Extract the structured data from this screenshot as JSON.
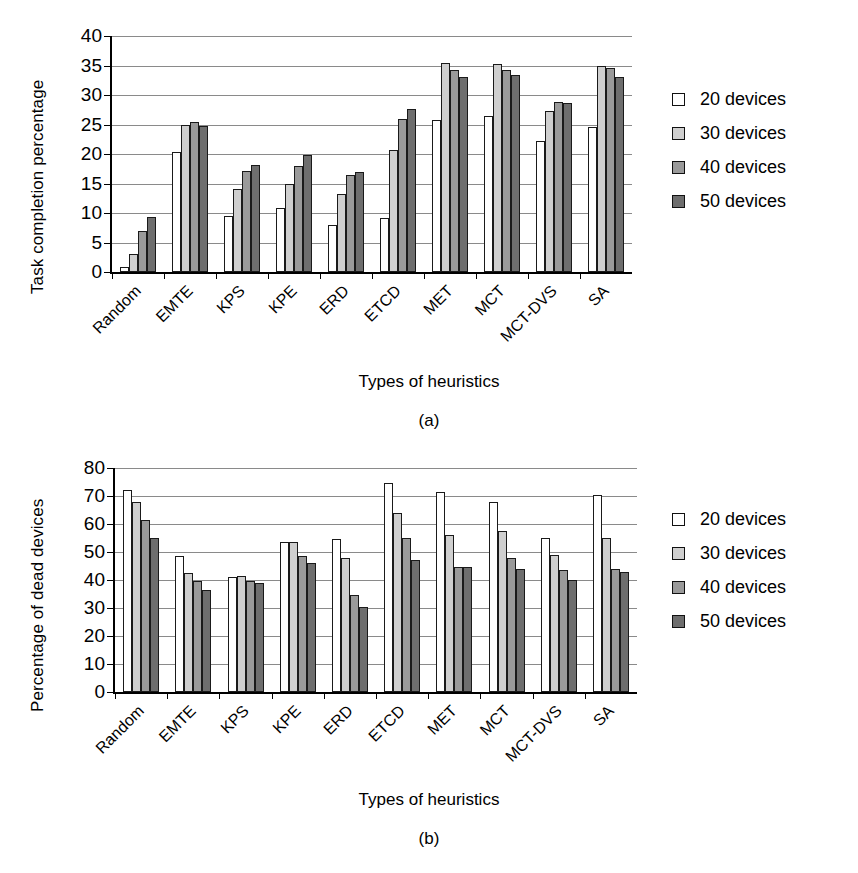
{
  "figure": {
    "panels": [
      {
        "id": "a",
        "caption": "(a)",
        "legend_position": "right"
      },
      {
        "id": "b",
        "caption": "(b)",
        "legend_position": "right"
      }
    ]
  },
  "chart_data": [
    {
      "type": "bar",
      "title": "",
      "panel": "(a)",
      "xlabel": "Types of heuristics",
      "ylabel": "Task completion percentage",
      "ylim": [
        0,
        40
      ],
      "yticks": [
        0,
        5,
        10,
        15,
        20,
        25,
        30,
        35,
        40
      ],
      "grid": true,
      "legend": "right",
      "categories": [
        "Random",
        "EMTE",
        "KPS",
        "KPE",
        "ERD",
        "ETCD",
        "MET",
        "MCT",
        "MCT-DVS",
        "SA"
      ],
      "series": [
        {
          "name": "20 devices",
          "color": "#ffffff",
          "values": [
            0.8,
            20.3,
            9.5,
            10.8,
            8.0,
            9.2,
            25.7,
            26.5,
            22.2,
            24.5
          ]
        },
        {
          "name": "30 devices",
          "color": "#cfcfcf",
          "values": [
            3.0,
            25.0,
            14.0,
            15.0,
            13.2,
            20.7,
            35.5,
            35.2,
            27.3,
            34.9
          ]
        },
        {
          "name": "40 devices",
          "color": "#9a9a9a",
          "values": [
            7.0,
            25.5,
            17.2,
            17.9,
            16.5,
            26.0,
            34.3,
            34.2,
            28.8,
            34.5
          ]
        },
        {
          "name": "50 devices",
          "color": "#6e6e6e",
          "values": [
            9.3,
            24.7,
            18.1,
            19.9,
            17.0,
            27.7,
            33.1,
            33.4,
            28.7,
            33.0
          ]
        }
      ]
    },
    {
      "type": "bar",
      "title": "",
      "panel": "(b)",
      "xlabel": "Types of heuristics",
      "ylabel": "Percentage of dead devices",
      "ylim": [
        0,
        80
      ],
      "yticks": [
        0,
        10,
        20,
        30,
        40,
        50,
        60,
        70,
        80
      ],
      "grid": true,
      "legend": "right",
      "categories": [
        "Random",
        "EMTE",
        "KPS",
        "KPE",
        "ERD",
        "ETCD",
        "MET",
        "MCT",
        "MCT-DVS",
        "SA"
      ],
      "series": [
        {
          "name": "20 devices",
          "color": "#ffffff",
          "values": [
            72.0,
            48.5,
            41.0,
            53.5,
            54.5,
            74.5,
            71.5,
            68.0,
            55.0,
            70.5
          ]
        },
        {
          "name": "30 devices",
          "color": "#cfcfcf",
          "values": [
            68.0,
            42.5,
            41.5,
            53.5,
            48.0,
            64.0,
            56.0,
            57.5,
            49.0,
            55.0
          ]
        },
        {
          "name": "40 devices",
          "color": "#9a9a9a",
          "values": [
            61.5,
            39.5,
            39.5,
            48.5,
            34.5,
            55.0,
            44.5,
            48.0,
            43.5,
            44.0
          ]
        },
        {
          "name": "50 devices",
          "color": "#6e6e6e",
          "values": [
            55.0,
            36.5,
            39.0,
            46.0,
            30.5,
            47.0,
            44.5,
            44.0,
            40.0,
            43.0
          ]
        }
      ]
    }
  ],
  "legend": {
    "items": [
      {
        "label": "20 devices",
        "swatch": "white-square-icon"
      },
      {
        "label": "30 devices",
        "swatch": "light-gray-square-icon"
      },
      {
        "label": "40 devices",
        "swatch": "medium-gray-square-icon"
      },
      {
        "label": "50 devices",
        "swatch": "dark-gray-square-icon"
      }
    ]
  }
}
